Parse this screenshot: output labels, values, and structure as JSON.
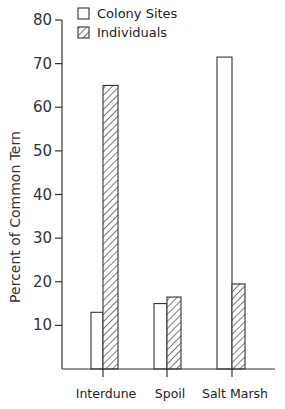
{
  "chart_data": {
    "type": "bar",
    "title": "",
    "xlabel": "",
    "ylabel": "Percent of Common Tern",
    "categories": [
      "Interdune",
      "Spoil",
      "Salt Marsh"
    ],
    "series": [
      {
        "name": "Colony Sites",
        "pattern": "open",
        "values": [
          13,
          15,
          71.5
        ]
      },
      {
        "name": "Individuals",
        "pattern": "hatched",
        "values": [
          65,
          16.5,
          19.5
        ]
      }
    ],
    "ylim": [
      0,
      80
    ],
    "yticks": [
      10,
      20,
      30,
      40,
      50,
      60,
      70,
      80
    ],
    "grid": false,
    "legend_position": "top-left inside"
  },
  "colors": {
    "line": "#333333",
    "background": "#ffffff"
  }
}
